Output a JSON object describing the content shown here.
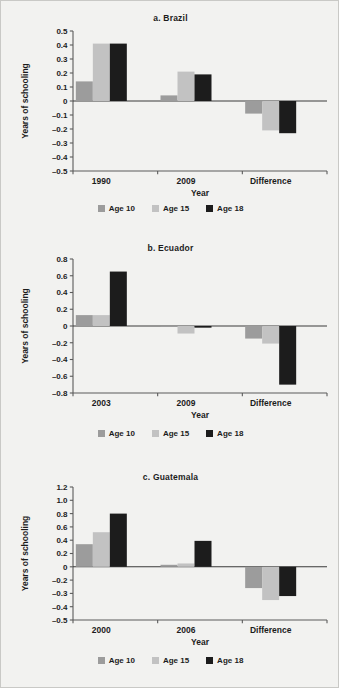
{
  "figure": {
    "background": "#f2f2f0",
    "series_colors": {
      "age10": "#9c9c9c",
      "age15": "#c2c2c2",
      "age18": "#1c1c1c"
    },
    "axis_color": "#5b5b5b",
    "text_color": "#1c1c1c"
  },
  "legend": {
    "items": [
      {
        "label": "Age 10",
        "color": "#9c9c9c",
        "swatch_name": "legend-swatch-age-10"
      },
      {
        "label": "Age 15",
        "color": "#c2c2c2",
        "swatch_name": "legend-swatch-age-15"
      },
      {
        "label": "Age 18",
        "color": "#1c1c1c",
        "swatch_name": "legend-swatch-age-18"
      }
    ]
  },
  "panels": [
    {
      "id": "brazil",
      "title": "a.  Brazil",
      "xlabel": "Year",
      "ylabel": "Years of schooling"
    },
    {
      "id": "ecuador",
      "title": "b.  Ecuador",
      "xlabel": "Year",
      "ylabel": "Years of schooling"
    },
    {
      "id": "guatemala",
      "title": "c.  Guatemala",
      "xlabel": "Year",
      "ylabel": "Years of schooling"
    }
  ],
  "chart_data": [
    {
      "type": "bar",
      "title": "a.  Brazil",
      "xlabel": "Year",
      "ylabel": "Years of schooling",
      "categories": [
        "1990",
        "2009",
        "Difference"
      ],
      "series": [
        {
          "name": "Age 10",
          "color": "#9c9c9c",
          "values": [
            0.14,
            0.04,
            -0.09
          ]
        },
        {
          "name": "Age 15",
          "color": "#c2c2c2",
          "values": [
            0.41,
            0.21,
            -0.21
          ]
        },
        {
          "name": "Age 18",
          "color": "#1c1c1c",
          "values": [
            0.41,
            0.19,
            -0.23
          ]
        }
      ],
      "ylim": [
        -0.5,
        0.5
      ],
      "yticks": [
        0.5,
        0.4,
        0.3,
        0.2,
        0.1,
        0,
        -0.1,
        -0.2,
        -0.3,
        -0.4,
        -0.5
      ],
      "ytick_labels": [
        "0.5",
        "0.4",
        "0.3",
        "0.2",
        "0.1",
        "0",
        "–0.1",
        "–0.2",
        "–0.3",
        "–0.4",
        "–0.5"
      ],
      "grid": false,
      "legend_position": "bottom"
    },
    {
      "type": "bar",
      "title": "b.  Ecuador",
      "xlabel": "Year",
      "ylabel": "Years of schooling",
      "categories": [
        "2003",
        "2009",
        "Difference"
      ],
      "series": [
        {
          "name": "Age 10",
          "color": "#9c9c9c",
          "values": [
            0.13,
            -0.01,
            -0.15
          ]
        },
        {
          "name": "Age 15",
          "color": "#c2c2c2",
          "values": [
            0.13,
            -0.09,
            -0.21
          ]
        },
        {
          "name": "Age 18",
          "color": "#1c1c1c",
          "values": [
            0.65,
            -0.02,
            -0.7
          ]
        }
      ],
      "ylim": [
        -0.8,
        0.8
      ],
      "yticks": [
        0.8,
        0.6,
        0.4,
        0.2,
        0,
        -0.2,
        -0.4,
        -0.6,
        -0.8
      ],
      "ytick_labels": [
        "0.8",
        "0.6",
        "0.4",
        "0.2",
        "0",
        "–0.2",
        "–0.4",
        "–0.6",
        "–0.8"
      ],
      "grid": false,
      "legend_position": "bottom"
    },
    {
      "type": "bar",
      "title": "c.  Guatemala",
      "xlabel": "Year",
      "ylabel": "Years of schooling",
      "categories": [
        "2000",
        "2006",
        "Difference"
      ],
      "series": [
        {
          "name": "Age 10",
          "color": "#9c9c9c",
          "values": [
            0.34,
            0.03,
            -0.26
          ]
        },
        {
          "name": "Age 15",
          "color": "#c2c2c2",
          "values": [
            0.52,
            0.05,
            -0.35
          ]
        },
        {
          "name": "Age 18",
          "color": "#1c1c1c",
          "values": [
            0.8,
            0.39,
            -0.32
          ]
        }
      ],
      "ylim": [
        -0.5,
        1.2
      ],
      "yticks": [
        1.2,
        1.0,
        0.8,
        0.6,
        0.4,
        0.2,
        0,
        -0.2,
        -0.3,
        -0.4,
        -0.5
      ],
      "ytick_labels": [
        "1.2",
        "1.0",
        "0.8",
        "0.6",
        "0.4",
        "0.2",
        "0",
        "–0.2",
        "–0.3",
        "–0.4",
        "–0.5"
      ],
      "grid": false,
      "legend_position": "bottom"
    }
  ]
}
